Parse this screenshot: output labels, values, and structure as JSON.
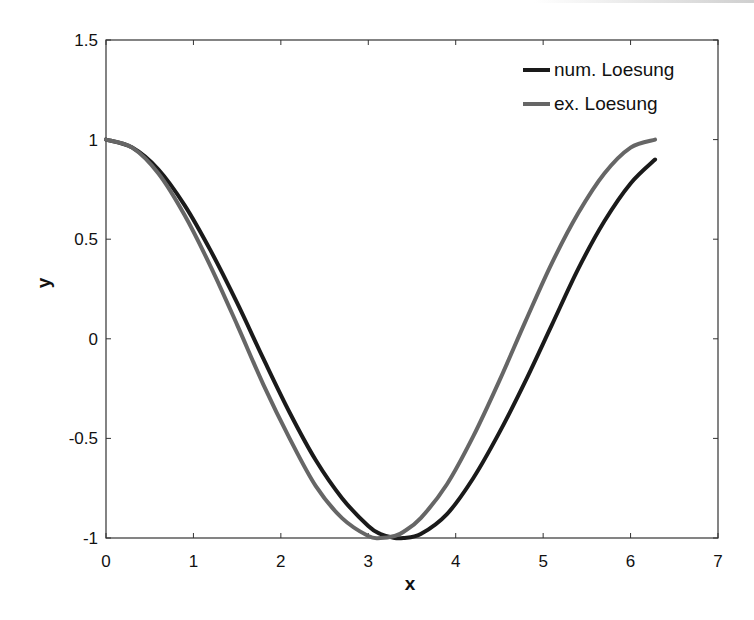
{
  "chart_data": {
    "type": "line",
    "title": "",
    "xlabel": "x",
    "ylabel": "y",
    "xlim": [
      0,
      7
    ],
    "ylim": [
      -1,
      1.5
    ],
    "xticks": [
      "0",
      "1",
      "2",
      "3",
      "4",
      "5",
      "6",
      "7"
    ],
    "yticks": [
      "1.5",
      "1",
      "0.5",
      "0",
      "-0.5",
      "-1"
    ],
    "grid": false,
    "legend_position": "upper right",
    "x": [
      0,
      0.3,
      0.6,
      0.9,
      1.2,
      1.5,
      1.8,
      2.1,
      2.4,
      2.7,
      3.0,
      3.14,
      3.3,
      3.4,
      3.6,
      3.9,
      4.2,
      4.5,
      4.8,
      5.1,
      5.4,
      5.7,
      6.0,
      6.28
    ],
    "series": [
      {
        "name": "num. Loesung",
        "color": "#1a1a1a",
        "values": [
          1.0,
          0.96,
          0.85,
          0.67,
          0.44,
          0.18,
          -0.1,
          -0.37,
          -0.61,
          -0.8,
          -0.94,
          -0.98,
          -1.0,
          -1.0,
          -0.98,
          -0.88,
          -0.7,
          -0.47,
          -0.21,
          0.07,
          0.35,
          0.59,
          0.78,
          0.9
        ]
      },
      {
        "name": "ex. Loesung",
        "color": "#666666",
        "values": [
          1.0,
          0.96,
          0.83,
          0.62,
          0.36,
          0.07,
          -0.23,
          -0.5,
          -0.74,
          -0.9,
          -0.99,
          -1.0,
          -0.99,
          -0.97,
          -0.9,
          -0.73,
          -0.49,
          -0.21,
          0.09,
          0.38,
          0.63,
          0.83,
          0.96,
          1.0
        ]
      }
    ]
  }
}
